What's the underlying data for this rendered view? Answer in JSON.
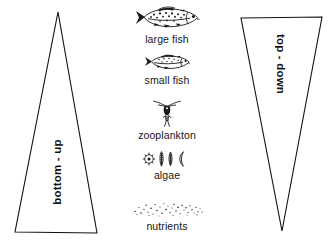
{
  "diagram": {
    "type": "trophic-control-diagram",
    "background_color": "#ffffff",
    "ink_color": "#1b1b1b"
  },
  "left_triangle": {
    "name": "bottom-up-triangle",
    "label": "bottom - up",
    "orientation": "apex-up",
    "meaning": "control strength increases toward the base of the food web"
  },
  "right_triangle": {
    "name": "top-down-triangle",
    "label": "top - down",
    "orientation": "apex-down",
    "meaning": "control strength increases toward the top of the food web"
  },
  "trophic_levels": [
    {
      "label": "large fish",
      "icon": "large-fish-icon",
      "rank": 1
    },
    {
      "label": "small fish",
      "icon": "small-fish-icon",
      "rank": 2
    },
    {
      "label": "zooplankton",
      "icon": "zooplankton-icon",
      "rank": 3
    },
    {
      "label": "algae",
      "icon": "algae-icon",
      "rank": 4
    },
    {
      "label": "nutrients",
      "icon": "nutrients-icon",
      "rank": 5
    }
  ]
}
